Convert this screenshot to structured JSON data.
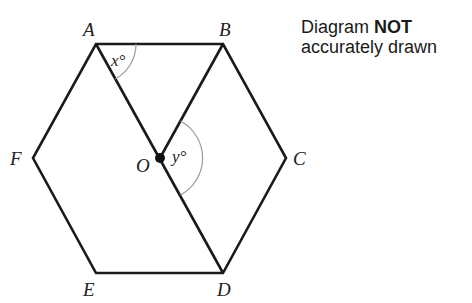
{
  "diagram": {
    "type": "regular hexagon with center",
    "vertices": [
      {
        "label": "A",
        "x": 96,
        "y": 44,
        "lx": 83,
        "ly": 36
      },
      {
        "label": "B",
        "x": 223,
        "y": 44,
        "lx": 220,
        "ly": 36
      },
      {
        "label": "C",
        "x": 286,
        "y": 158,
        "lx": 294,
        "ly": 165
      },
      {
        "label": "D",
        "x": 223,
        "y": 273,
        "lx": 217,
        "ly": 296
      },
      {
        "label": "E",
        "x": 96,
        "y": 273,
        "lx": 83,
        "ly": 296
      },
      {
        "label": "F",
        "x": 33,
        "y": 158,
        "lx": 11,
        "ly": 165
      }
    ],
    "center": {
      "label": "O",
      "x": 160,
      "y": 158,
      "lx": 137,
      "ly": 172
    },
    "segments": [
      "AB",
      "BC",
      "CD",
      "DE",
      "EF",
      "FA",
      "AO",
      "OD",
      "OB"
    ],
    "angles": [
      {
        "label": "x°",
        "vertex": "A",
        "between": [
          "AB",
          "AO"
        ]
      },
      {
        "label": "y°",
        "vertex": "O",
        "between": [
          "OB",
          "OD"
        ]
      }
    ],
    "angle_labels": {
      "x": "x°",
      "y": "y°"
    }
  },
  "note": {
    "line1_prefix": "Diagram ",
    "line1_bold": "NOT",
    "line2": "accurately drawn"
  },
  "colors": {
    "stroke": "#1a1a1a",
    "arc": "#9a9a9a",
    "text": "#222222"
  }
}
